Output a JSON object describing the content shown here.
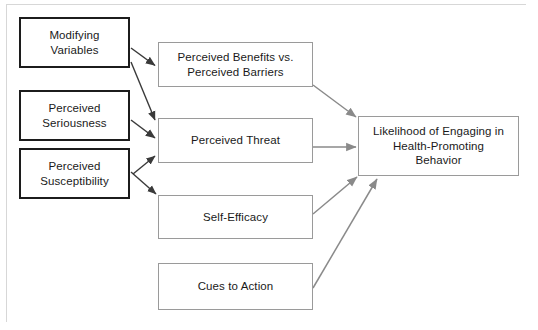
{
  "diagram": {
    "colors": {
      "primary_border": "#1c1c1c",
      "secondary_border": "#9a9a9a",
      "arrow": "#8a8a8a",
      "arrow_dark": "#3a3a3a",
      "text": "#1a1a1a",
      "background": "#ffffff"
    },
    "nodes": [
      {
        "id": "modifying-variables",
        "label": "Modifying\nVariables",
        "group": "primary",
        "x": 19,
        "y": 17,
        "w": 111,
        "h": 51
      },
      {
        "id": "perceived-seriousness",
        "label": "Perceived\nSeriousness",
        "group": "primary",
        "x": 19,
        "y": 90,
        "w": 111,
        "h": 51
      },
      {
        "id": "perceived-susceptibility",
        "label": "Perceived\nSusceptibility",
        "group": "primary",
        "x": 19,
        "y": 148,
        "w": 111,
        "h": 51
      },
      {
        "id": "perceived-benefits-vs-barriers",
        "label": "Perceived Benefits vs.\nPerceived Barriers",
        "group": "secondary",
        "x": 158,
        "y": 42,
        "w": 155,
        "h": 45
      },
      {
        "id": "perceived-threat",
        "label": "Perceived Threat",
        "group": "secondary",
        "x": 158,
        "y": 118,
        "w": 155,
        "h": 45
      },
      {
        "id": "self-efficacy",
        "label": "Self-Efficacy",
        "group": "secondary",
        "x": 158,
        "y": 195,
        "w": 155,
        "h": 44
      },
      {
        "id": "cues-to-action",
        "label": "Cues to Action",
        "group": "secondary",
        "x": 158,
        "y": 263,
        "w": 155,
        "h": 47
      },
      {
        "id": "likelihood-of-engaging",
        "label": "Likelihood of Engaging in\nHealth-Promoting\nBehavior",
        "group": "outcome",
        "x": 358,
        "y": 116,
        "w": 161,
        "h": 60
      }
    ],
    "edges": [
      {
        "id": "modifying-to-benefits",
        "from": "modifying-variables",
        "to": "perceived-benefits-vs-barriers",
        "style": "dark"
      },
      {
        "id": "modifying-to-threat",
        "from": "modifying-variables",
        "to": "perceived-threat",
        "style": "dark"
      },
      {
        "id": "seriousness-to-threat",
        "from": "perceived-seriousness",
        "to": "perceived-threat",
        "style": "dark"
      },
      {
        "id": "susceptibility-to-threat",
        "from": "perceived-susceptibility",
        "to": "perceived-threat",
        "style": "dark"
      },
      {
        "id": "susceptibility-to-self-efficacy",
        "from": "perceived-susceptibility",
        "to": "self-efficacy",
        "style": "dark"
      },
      {
        "id": "benefits-to-likelihood",
        "from": "perceived-benefits-vs-barriers",
        "to": "likelihood-of-engaging",
        "style": "light"
      },
      {
        "id": "threat-to-likelihood",
        "from": "perceived-threat",
        "to": "likelihood-of-engaging",
        "style": "light"
      },
      {
        "id": "self-efficacy-to-likelihood",
        "from": "self-efficacy",
        "to": "likelihood-of-engaging",
        "style": "light"
      },
      {
        "id": "cues-to-likelihood",
        "from": "cues-to-action",
        "to": "likelihood-of-engaging",
        "style": "light"
      }
    ]
  }
}
